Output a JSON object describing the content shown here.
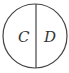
{
  "diagram": {
    "shape": "circle divided by vertical diameter",
    "regions": [
      {
        "label": "C"
      },
      {
        "label": "D"
      }
    ],
    "colors": {
      "stroke": "#444444",
      "text": "#333333",
      "background": "#ffffff"
    }
  }
}
